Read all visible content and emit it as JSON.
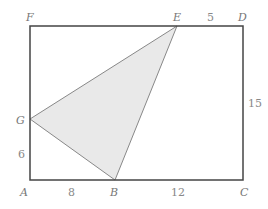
{
  "diagram": {
    "colors": {
      "outline": "#444444",
      "triangle_fill": "#e9e9e9",
      "triangle_stroke": "#888888",
      "label": "#777777"
    },
    "points": {
      "A": "A",
      "B": "B",
      "C": "C",
      "D": "D",
      "E": "E",
      "F": "F",
      "G": "G"
    },
    "measures": {
      "AB": "8",
      "BC": "12",
      "ED": "5",
      "DC": "15",
      "AG": "6"
    }
  }
}
